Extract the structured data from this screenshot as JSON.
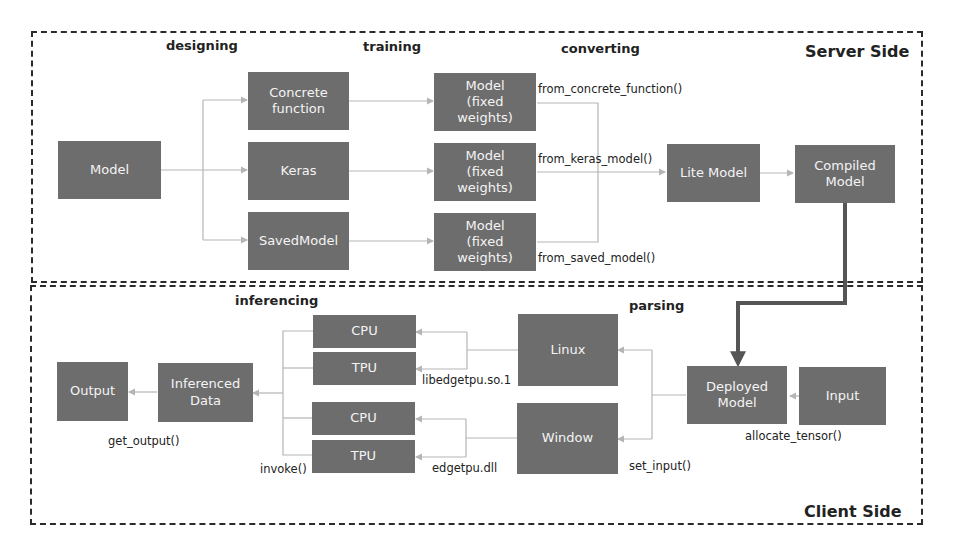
{
  "regions": {
    "server": {
      "title": "Server Side"
    },
    "client": {
      "title": "Client Side"
    }
  },
  "stages": {
    "designing": "designing",
    "training": "training",
    "converting": "converting",
    "inferencing": "inferencing",
    "parsing": "parsing"
  },
  "server": {
    "model": "Model",
    "concrete_function": "Concrete\nfunction",
    "keras": "Keras",
    "saved_model": "SavedModel",
    "fixed_1": "Model\n(fixed\nweights)",
    "fixed_2": "Model\n(fixed\nweights)",
    "fixed_3": "Model\n(fixed\nweights)",
    "lite_model": "Lite Model",
    "compiled_model": "Compiled\nModel",
    "fn_concrete": "from_concrete_function()",
    "fn_keras": "from_keras_model()",
    "fn_saved": "from_saved_model()"
  },
  "client": {
    "output": "Output",
    "inferenced_data": "Inferenced\nData",
    "cpu_1": "CPU",
    "tpu_1": "TPU",
    "cpu_2": "CPU",
    "tpu_2": "TPU",
    "linux": "Linux",
    "window": "Window",
    "deployed_model": "Deployed\nModel",
    "input": "Input",
    "fn_get_output": "get_output()",
    "fn_invoke": "invoke()",
    "fn_libedgetpu": "libedgetpu.so.1",
    "fn_edgetpu": "edgetpu.dll",
    "fn_set_input": "set_input()",
    "fn_allocate": "allocate_tensor()"
  },
  "colors": {
    "box_fill": "#6d6d6d",
    "box_text": "#f4f4f4",
    "wire": "#b5b5b5",
    "deploy_arrow": "#555555",
    "border": "#2b2b2b"
  }
}
